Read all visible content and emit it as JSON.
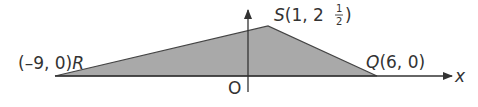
{
  "diagram": {
    "type": "coordinate-geometry",
    "shape": "triangle",
    "fill_color": "#a9a9a9",
    "stroke_color": "#444444",
    "points": {
      "R": {
        "label": "R",
        "coords_text": "(–9, 0)",
        "x": -9,
        "y": 0
      },
      "S": {
        "label": "S",
        "coords_text_prefix": "(1, 2",
        "fraction_num": "1",
        "fraction_den": "2",
        "coords_text_suffix": ")",
        "x": 1,
        "y": 2.5
      },
      "Q": {
        "label": "Q",
        "coords_text": "(6, 0)",
        "x": 6,
        "y": 0
      }
    },
    "axes": {
      "x_label": "x",
      "origin_label": "O"
    }
  }
}
